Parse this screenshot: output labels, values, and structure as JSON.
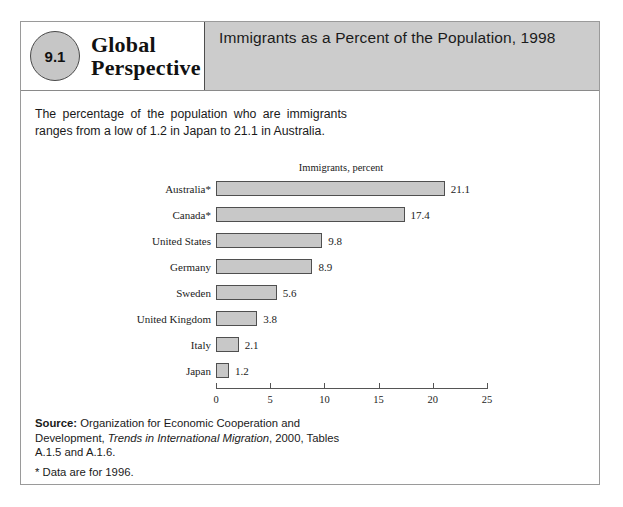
{
  "badge": {
    "number": "9.1",
    "line1": "Global",
    "line2": "Perspective"
  },
  "header": {
    "title": "Immigrants as a Percent of the Population, 1998"
  },
  "intro": {
    "text": "The percentage of the population who are immigrants ranges from a low of 1.2 in Japan to 21.1 in Australia."
  },
  "source": {
    "label": "Source:",
    "part1": " Organization for Economic Cooperation and Development, ",
    "italic": "Trends in International Migration",
    "part2": ", 2000, Tables A.1.5 and A.1.6.",
    "footnote": "* Data are for 1996."
  },
  "chart_data": {
    "type": "bar",
    "orientation": "horizontal",
    "title": "Immigrants, percent",
    "xlabel": "",
    "ylabel": "",
    "xlim": [
      0,
      25
    ],
    "ticks": [
      0,
      5,
      10,
      15,
      20,
      25
    ],
    "grid": false,
    "legend": null,
    "bar_color": "#c8c8c8",
    "bar_border": "#4f4f4f",
    "categories": [
      "Australia*",
      "Canada*",
      "United States",
      "Germany",
      "Sweden",
      "United Kingdom",
      "Italy",
      "Japan"
    ],
    "values": [
      21.1,
      17.4,
      9.8,
      8.9,
      5.6,
      3.8,
      2.1,
      1.2
    ],
    "value_labels": [
      "21.1",
      "17.4",
      "9.8",
      "8.9",
      "5.6",
      "3.8",
      "2.1",
      "1.2"
    ],
    "tick_labels": [
      "0",
      "5",
      "10",
      "15",
      "20",
      "25"
    ]
  }
}
